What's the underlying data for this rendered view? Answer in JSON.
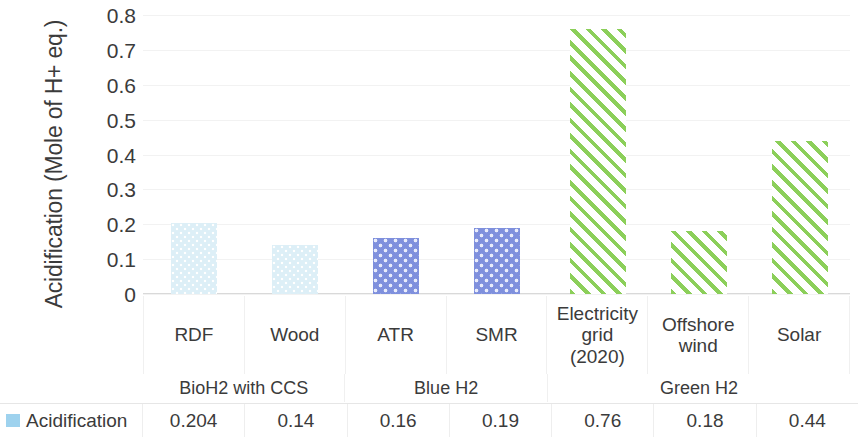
{
  "chart_data": {
    "type": "bar",
    "title": "",
    "xlabel": "",
    "ylabel": "Acidification (Mole of H+ eq.)",
    "ylim": [
      0,
      0.8
    ],
    "ytick_labels": [
      "0.8",
      "0.7",
      "0.6",
      "0.5",
      "0.4",
      "0.3",
      "0.2",
      "0.1",
      "0"
    ],
    "ytick_values": [
      0.8,
      0.7,
      0.6,
      0.5,
      0.4,
      0.3,
      0.2,
      0.1,
      0
    ],
    "grid": true,
    "legend_position": "bottom-left",
    "categories": [
      "RDF",
      "Wood",
      "ATR",
      "SMR",
      "Electricity grid (2020)",
      "Offshore wind",
      "Solar"
    ],
    "category_lines": [
      [
        "RDF"
      ],
      [
        "Wood"
      ],
      [
        "ATR"
      ],
      [
        "SMR"
      ],
      [
        "Electricity",
        "grid",
        "(2020)"
      ],
      [
        "Offshore",
        "wind"
      ],
      [
        "Solar"
      ]
    ],
    "series": [
      {
        "name": "Acidification",
        "values": [
          0.204,
          0.14,
          0.16,
          0.19,
          0.76,
          0.18,
          0.44
        ],
        "value_labels": [
          "0.204",
          "0.14",
          "0.16",
          "0.19",
          "0.76",
          "0.18",
          "0.44"
        ]
      }
    ],
    "bar_styles": [
      "light-blue-dotted",
      "light-blue-dotted",
      "periwinkle-dotted",
      "periwinkle-dotted",
      "green-hatched",
      "green-hatched",
      "green-hatched"
    ],
    "groups": [
      {
        "label": "BioH2 with CCS",
        "span": 2
      },
      {
        "label": "Blue H2",
        "span": 2
      },
      {
        "label": "Green H2",
        "span": 3
      }
    ],
    "colors": {
      "light_blue": "#ddeff7",
      "periwinkle": "#7f90dd",
      "green": "#8ccf5a",
      "legend_swatch": "#9ed2ee",
      "gridline": "#f2f2f2",
      "text": "#3b3b3b"
    }
  },
  "legend": {
    "label": "Acidification"
  }
}
